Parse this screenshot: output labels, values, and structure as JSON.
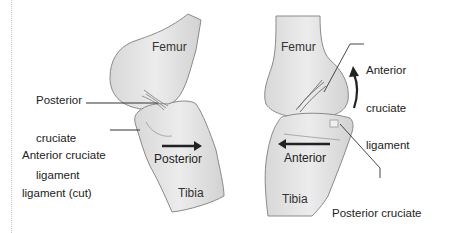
{
  "diagram": {
    "left_panel": {
      "bones": {
        "femur": "Femur",
        "tibia": "Tibia"
      },
      "labels": {
        "posterior_cruciate": [
          "Posterior",
          "cruciate",
          "ligament"
        ],
        "anterior_cruciate_cut": [
          "Anterior cruciate",
          "ligament (cut)"
        ]
      },
      "direction": {
        "label": "Posterior",
        "arrow": "right-arrow"
      }
    },
    "right_panel": {
      "bones": {
        "femur": "Femur",
        "tibia": "Tibia"
      },
      "labels": {
        "anterior_cruciate": [
          "Anterior",
          "cruciate",
          "ligament"
        ],
        "posterior_cruciate_cut": [
          "Posterior cruciate",
          "ligament (cut)"
        ]
      },
      "direction": {
        "label": "Anterior",
        "arrow": "left-arrow"
      },
      "rotation_arrow": "curved-up-arrow"
    },
    "colors": {
      "bone_fill": "#e6e6e6",
      "bone_stroke": "#8a8a8a",
      "arrow": "#222222",
      "text": "#222222"
    }
  }
}
